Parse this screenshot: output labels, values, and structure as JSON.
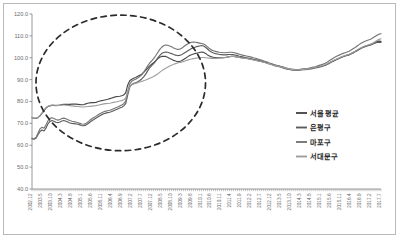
{
  "chart_data": {
    "type": "line",
    "title": "",
    "xlabel": "",
    "ylabel": "",
    "ylim": [
      40.0,
      120.0
    ],
    "ytick_labels": [
      "120.0",
      "110.0",
      "100.0",
      "90.0",
      "80.0",
      "70.0",
      "60.0",
      "50.0",
      "40.0"
    ],
    "ytick_values": [
      120.0,
      110.0,
      100.0,
      90.0,
      80.0,
      70.0,
      60.0,
      50.0,
      40.0
    ],
    "grid": false,
    "legend_position": "right-middle",
    "annotations": [
      {
        "name": "highlight-ellipse",
        "shape": "ellipse",
        "style": "dashed",
        "x_range": [
          "2003.2",
          "2010.3"
        ],
        "y_range": [
          57.5,
          119.5
        ]
      }
    ],
    "categories": [
      "2002.12",
      "2003.1",
      "2003.2",
      "2003.3",
      "2003.4",
      "2003.5",
      "2003.6",
      "2003.7",
      "2003.8",
      "2003.9",
      "2003.10",
      "2003.11",
      "2003.12",
      "2004.1",
      "2004.2",
      "2004.3",
      "2004.4",
      "2004.5",
      "2004.6",
      "2004.7",
      "2004.8",
      "2004.9",
      "2004.10",
      "2004.11",
      "2004.12",
      "2005.1",
      "2005.2",
      "2005.3",
      "2005.4",
      "2005.5",
      "2005.6",
      "2005.7",
      "2005.8",
      "2005.9",
      "2005.10",
      "2005.11",
      "2005.12",
      "2006.1",
      "2006.2",
      "2006.3",
      "2006.4",
      "2006.5",
      "2006.6",
      "2006.7",
      "2006.8",
      "2006.9",
      "2006.10",
      "2006.11",
      "2006.12",
      "2007.1",
      "2007.2",
      "2007.3",
      "2007.4",
      "2007.5",
      "2007.6",
      "2007.7",
      "2007.8",
      "2007.9",
      "2007.10",
      "2007.11",
      "2007.12",
      "2008.1",
      "2008.2",
      "2008.3",
      "2008.4",
      "2008.5",
      "2008.6",
      "2008.7",
      "2008.8",
      "2008.9",
      "2008.10",
      "2008.11",
      "2008.12",
      "2009.1",
      "2009.2",
      "2009.3",
      "2009.4",
      "2009.5",
      "2009.6",
      "2009.7",
      "2009.8",
      "2009.9",
      "2009.10",
      "2009.11",
      "2009.12",
      "2010.1",
      "2010.2",
      "2010.3",
      "2010.4",
      "2010.5",
      "2010.6",
      "2010.7",
      "2010.8",
      "2010.9",
      "2010.10",
      "2010.11",
      "2010.12",
      "2011.1",
      "2011.2",
      "2011.3",
      "2011.4",
      "2011.5",
      "2011.6",
      "2011.7",
      "2011.8",
      "2011.9",
      "2011.10",
      "2011.11",
      "2011.12",
      "2012.1",
      "2012.2",
      "2012.3",
      "2012.4",
      "2012.5",
      "2012.6",
      "2012.7",
      "2012.8",
      "2012.9",
      "2012.10",
      "2012.11",
      "2012.12",
      "2013.1",
      "2013.2",
      "2013.3",
      "2013.4",
      "2013.5",
      "2013.6",
      "2013.7",
      "2013.8",
      "2013.9",
      "2013.10",
      "2013.11",
      "2013.12",
      "2014.1",
      "2014.2",
      "2014.3",
      "2014.4",
      "2014.5",
      "2014.6",
      "2014.7",
      "2014.8",
      "2014.9",
      "2014.10",
      "2014.11",
      "2014.12",
      "2015.1",
      "2015.2",
      "2015.3",
      "2015.4",
      "2015.5",
      "2015.6",
      "2015.7",
      "2015.8",
      "2015.9",
      "2015.10",
      "2015.11",
      "2015.12",
      "2016.1",
      "2016.2",
      "2016.3",
      "2016.4",
      "2016.5",
      "2016.6",
      "2016.7",
      "2016.8",
      "2016.9",
      "2016.10",
      "2016.11",
      "2016.12",
      "2017.1",
      "2017.2",
      "2017.3",
      "2017.4",
      "2017.5",
      "2017.6",
      "2017.7"
    ],
    "xtick_labels": [
      "2002.12",
      "2003.5",
      "2003.10",
      "2004.3",
      "2004.8",
      "2005.1",
      "2005.6",
      "2005.11",
      "2006.4",
      "2006.9",
      "2007.2",
      "2007.7",
      "2007.12",
      "2008.5",
      "2008.10",
      "2009.3",
      "2009.8",
      "2010.1",
      "2010.6",
      "2010.11",
      "2011.4",
      "2011.9",
      "2012.2",
      "2012.7",
      "2012.12",
      "2013.5",
      "2013.10",
      "2014.3",
      "2014.8",
      "2015.1",
      "2015.6",
      "2015.11",
      "2016.4",
      "2016.9",
      "2017.2",
      "2017.7"
    ],
    "xtick_interval_months": 5,
    "series": [
      {
        "name": "서울 평균",
        "color": "#4a4a4a",
        "values": [
          72.6,
          72.4,
          72.3,
          72.6,
          73.4,
          74.6,
          75.8,
          77.0,
          77.7,
          78.0,
          78.3,
          78.2,
          78.1,
          78.2,
          78.4,
          78.6,
          78.7,
          78.7,
          78.7,
          78.7,
          78.8,
          78.8,
          78.8,
          78.7,
          78.6,
          78.5,
          78.6,
          78.9,
          79.2,
          79.4,
          79.5,
          79.5,
          79.6,
          79.9,
          80.2,
          80.4,
          80.6,
          80.8,
          81.0,
          81.3,
          81.6,
          81.9,
          82.2,
          82.3,
          82.4,
          82.6,
          83.0,
          84.0,
          87.6,
          89.5,
          90.2,
          90.6,
          91.0,
          91.5,
          92.0,
          92.5,
          93.3,
          94.2,
          95.3,
          96.3,
          97.0,
          97.7,
          98.6,
          99.5,
          100.2,
          100.6,
          100.7,
          100.6,
          100.2,
          99.7,
          99.3,
          98.8,
          98.5,
          98.2,
          98.3,
          98.6,
          99.2,
          99.8,
          100.4,
          101.0,
          101.4,
          101.7,
          102.0,
          102.2,
          102.4,
          102.6,
          102.5,
          102.0,
          101.3,
          100.8,
          100.4,
          100.2,
          100.1,
          100.0,
          100.0,
          100.0,
          100.0,
          100.1,
          100.3,
          100.5,
          100.6,
          100.6,
          100.5,
          100.3,
          100.1,
          100.0,
          99.9,
          99.8,
          99.7,
          99.5,
          99.3,
          99.1,
          98.9,
          98.7,
          98.5,
          98.3,
          98.1,
          97.9,
          97.7,
          97.4,
          97.1,
          96.8,
          96.6,
          96.4,
          96.2,
          96.0,
          95.7,
          95.4,
          95.2,
          95.0,
          94.8,
          94.7,
          94.6,
          94.6,
          94.6,
          94.7,
          94.8,
          94.9,
          95.0,
          95.1,
          95.2,
          95.4,
          95.6,
          95.8,
          96.0,
          96.2,
          96.4,
          96.7,
          97.1,
          97.6,
          98.1,
          98.5,
          98.9,
          99.3,
          99.7,
          100.1,
          100.5,
          100.8,
          101.0,
          101.3,
          101.7,
          102.2,
          102.7,
          103.2,
          103.8,
          104.3,
          104.8,
          105.2,
          105.5,
          105.8,
          106.1,
          106.5,
          107.0,
          107.4,
          107.6,
          107.5
        ]
      },
      {
        "name": "은평구",
        "color": "#5c5c5c",
        "values": [
          63.0,
          62.8,
          63.2,
          64.8,
          66.3,
          67.0,
          66.5,
          67.8,
          69.8,
          70.9,
          71.3,
          71.0,
          70.5,
          70.3,
          70.6,
          71.1,
          71.3,
          71.0,
          70.6,
          70.2,
          70.0,
          69.9,
          69.8,
          69.6,
          69.3,
          69.0,
          68.9,
          69.2,
          69.8,
          70.5,
          71.2,
          71.8,
          72.3,
          72.9,
          73.5,
          74.0,
          74.4,
          74.7,
          74.9,
          75.1,
          75.4,
          75.8,
          76.2,
          76.6,
          77.0,
          77.4,
          78.0,
          79.0,
          83.0,
          86.5,
          87.8,
          88.3,
          88.6,
          89.0,
          89.6,
          90.3,
          91.3,
          92.5,
          94.0,
          95.4,
          96.4,
          97.3,
          98.5,
          99.8,
          101.0,
          101.9,
          102.4,
          102.6,
          102.5,
          102.2,
          101.9,
          101.5,
          101.2,
          101.0,
          101.1,
          101.4,
          101.9,
          102.5,
          103.1,
          103.7,
          104.2,
          104.6,
          104.9,
          105.2,
          105.4,
          105.6,
          105.4,
          104.8,
          104.0,
          103.2,
          102.6,
          102.2,
          101.9,
          101.7,
          101.5,
          101.4,
          101.3,
          101.3,
          101.4,
          101.5,
          101.5,
          101.4,
          101.2,
          101.0,
          100.7,
          100.5,
          100.3,
          100.1,
          99.9,
          99.7,
          99.5,
          99.3,
          99.1,
          98.9,
          98.7,
          98.4,
          98.1,
          97.8,
          97.5,
          97.2,
          96.9,
          96.6,
          96.3,
          96.1,
          95.9,
          95.6,
          95.3,
          95.0,
          94.8,
          94.6,
          94.4,
          94.3,
          94.3,
          94.3,
          94.3,
          94.4,
          94.5,
          94.6,
          94.7,
          94.8,
          94.9,
          95.1,
          95.3,
          95.5,
          95.7,
          95.9,
          96.2,
          96.5,
          96.9,
          97.4,
          97.9,
          98.4,
          98.9,
          99.4,
          99.8,
          100.2,
          100.6,
          100.9,
          101.2,
          101.5,
          101.9,
          102.4,
          102.9,
          103.4,
          103.9,
          104.4,
          104.8,
          105.1,
          105.4,
          105.6,
          105.9,
          106.3,
          106.7,
          107.0,
          107.1,
          107.0
        ]
      },
      {
        "name": "마포구",
        "color": "#757575",
        "values": [
          63.2,
          63.0,
          63.5,
          65.5,
          67.5,
          68.2,
          67.8,
          69.2,
          71.2,
          72.3,
          72.6,
          72.2,
          71.8,
          71.5,
          71.8,
          72.2,
          72.4,
          72.1,
          71.7,
          71.3,
          71.0,
          70.8,
          70.6,
          70.3,
          70.0,
          69.7,
          69.6,
          69.9,
          70.6,
          71.4,
          72.1,
          72.7,
          73.2,
          73.8,
          74.4,
          74.9,
          75.3,
          75.6,
          75.8,
          76.0,
          76.3,
          76.7,
          77.1,
          77.5,
          78.0,
          78.4,
          79.0,
          80.2,
          84.5,
          88.0,
          89.3,
          89.8,
          90.2,
          90.7,
          91.4,
          92.2,
          93.4,
          94.8,
          96.3,
          97.6,
          98.6,
          99.6,
          100.9,
          102.3,
          103.7,
          104.8,
          105.5,
          105.8,
          105.7,
          105.4,
          105.0,
          104.5,
          104.1,
          103.8,
          103.9,
          104.3,
          105.0,
          105.7,
          106.3,
          106.8,
          107.1,
          107.2,
          107.1,
          106.9,
          106.7,
          106.5,
          106.3,
          105.8,
          105.0,
          104.2,
          103.6,
          103.2,
          102.9,
          102.7,
          102.5,
          102.4,
          102.3,
          102.3,
          102.4,
          102.5,
          102.5,
          102.4,
          102.2,
          101.9,
          101.6,
          101.3,
          101.1,
          100.9,
          100.7,
          100.5,
          100.3,
          100.0,
          99.8,
          99.5,
          99.2,
          98.9,
          98.6,
          98.3,
          98.0,
          97.6,
          97.3,
          97.0,
          96.7,
          96.4,
          96.1,
          95.8,
          95.5,
          95.2,
          95.0,
          94.8,
          94.6,
          94.5,
          94.5,
          94.5,
          94.6,
          94.7,
          94.8,
          94.9,
          95.1,
          95.3,
          95.5,
          95.7,
          95.9,
          96.2,
          96.5,
          96.8,
          97.1,
          97.5,
          98.0,
          98.6,
          99.2,
          99.8,
          100.3,
          100.8,
          101.2,
          101.6,
          102.0,
          102.3,
          102.6,
          103.0,
          103.5,
          104.1,
          104.7,
          105.4,
          106.0,
          106.6,
          107.1,
          107.5,
          107.9,
          108.2,
          108.6,
          109.1,
          109.7,
          110.3,
          110.8,
          111.0
        ]
      },
      {
        "name": "서대문구",
        "color": "#9e9e9e",
        "values": [
          72.8,
          72.5,
          72.4,
          72.8,
          73.6,
          74.8,
          76.0,
          77.2,
          77.8,
          78.1,
          78.4,
          78.3,
          78.2,
          78.2,
          78.3,
          78.4,
          78.4,
          78.3,
          78.2,
          78.1,
          78.0,
          77.9,
          77.8,
          77.7,
          77.6,
          77.5,
          77.5,
          77.6,
          77.7,
          77.8,
          77.9,
          78.0,
          78.1,
          78.3,
          78.5,
          78.7,
          78.9,
          79.0,
          79.1,
          79.2,
          79.4,
          79.6,
          79.8,
          80.0,
          80.2,
          80.4,
          80.8,
          81.6,
          84.5,
          86.8,
          87.6,
          88.0,
          88.3,
          88.6,
          88.9,
          89.2,
          89.5,
          89.8,
          90.2,
          90.6,
          91.0,
          91.4,
          92.0,
          92.6,
          93.3,
          94.0,
          94.6,
          95.2,
          95.7,
          96.2,
          96.6,
          97.0,
          97.3,
          97.6,
          97.8,
          98.0,
          98.3,
          98.6,
          98.9,
          99.2,
          99.4,
          99.6,
          99.8,
          99.9,
          100.0,
          100.1,
          100.1,
          100.0,
          99.9,
          99.8,
          99.7,
          99.7,
          99.7,
          99.7,
          99.8,
          99.9,
          100.0,
          100.1,
          100.3,
          100.5,
          100.6,
          100.6,
          100.5,
          100.3,
          100.1,
          99.9,
          99.8,
          99.7,
          99.6,
          99.4,
          99.2,
          99.0,
          98.8,
          98.6,
          98.4,
          98.2,
          98.0,
          97.7,
          97.5,
          97.2,
          96.9,
          96.6,
          96.4,
          96.2,
          96.0,
          95.8,
          95.5,
          95.3,
          95.1,
          94.9,
          94.7,
          94.6,
          94.5,
          94.5,
          94.5,
          94.6,
          94.7,
          94.8,
          94.9,
          95.0,
          95.2,
          95.4,
          95.6,
          95.8,
          96.0,
          96.2,
          96.5,
          96.8,
          97.2,
          97.7,
          98.2,
          98.7,
          99.1,
          99.5,
          99.9,
          100.3,
          100.7,
          101.0,
          101.3,
          101.6,
          102.0,
          102.5,
          103.0,
          103.6,
          104.1,
          104.6,
          105.0,
          105.4,
          105.7,
          106.0,
          106.3,
          106.8,
          107.3,
          107.9,
          108.4,
          108.7
        ]
      }
    ]
  },
  "legend": {
    "items": [
      {
        "label": "서울 평균",
        "color": "#4a4a4a"
      },
      {
        "label": "은평구",
        "color": "#5c5c5c"
      },
      {
        "label": "마포구",
        "color": "#757575"
      },
      {
        "label": "서대문구",
        "color": "#9e9e9e"
      }
    ]
  },
  "colors": {
    "frame_border": "#b9b9b9",
    "axis": "#808080",
    "tick_text": "#6b6b6b",
    "annotation": "#2b2b2b",
    "background": "#ffffff"
  }
}
